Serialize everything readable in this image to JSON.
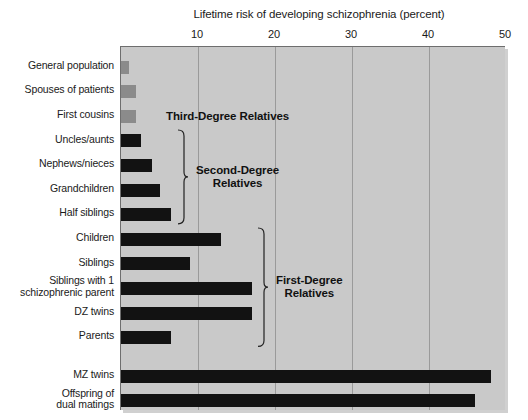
{
  "chart_data": {
    "type": "bar",
    "orientation": "horizontal",
    "title": "Lifetime risk of developing schizophrenia (percent)",
    "xlabel": "Lifetime risk of developing schizophrenia (percent)",
    "ylabel": "",
    "xlim": [
      0,
      50
    ],
    "xticks": [
      10,
      20,
      30,
      40,
      50
    ],
    "xtick_labels": [
      "10",
      "20",
      "30",
      "40",
      "50"
    ],
    "grid": "vertical",
    "legend": "none",
    "categories": [
      "General population",
      "Spouses of patients",
      "First cousins",
      "Uncles/aunts",
      "Nephews/nieces",
      "Grandchildren",
      "Half siblings",
      "Children",
      "Siblings",
      "Siblings with 1\nschizophrenic parent",
      "DZ twins",
      "Parents",
      "MZ twins",
      "Offspring of\ndual matings"
    ],
    "values": [
      1,
      2,
      2,
      2.6,
      4,
      5,
      6.5,
      13,
      9,
      17,
      17,
      6.5,
      48,
      46
    ],
    "bar_colors": [
      "#8b8b8b",
      "#8b8b8b",
      "#8b8b8b",
      "#121212",
      "#121212",
      "#121212",
      "#121212",
      "#121212",
      "#121212",
      "#121212",
      "#121212",
      "#121212",
      "#121212",
      "#121212"
    ],
    "annotations": [
      {
        "text": "Third-Degree Relatives",
        "group_rows": [
          0,
          2
        ]
      },
      {
        "text": "Second-Degree\nRelatives",
        "group_rows": [
          3,
          6
        ]
      },
      {
        "text": "First-Degree\nRelatives",
        "group_rows": [
          7,
          11
        ]
      }
    ],
    "colors": {
      "plot_background": "#c9c9c9",
      "gridline": "#9a9a9a",
      "bar_third_degree": "#8b8b8b",
      "bar_close_relative": "#121212",
      "text": "#1a1a1a",
      "page_background": "#ffffff"
    }
  },
  "axis": {
    "ticks": [
      {
        "label": "10",
        "value": 10
      },
      {
        "label": "20",
        "value": 20
      },
      {
        "label": "30",
        "value": 30
      },
      {
        "label": "40",
        "value": 40
      },
      {
        "label": "50",
        "value": 50
      }
    ]
  },
  "groups": {
    "third": "Third-Degree Relatives",
    "second": "Second-Degree\nRelatives",
    "first": "First-Degree\nRelatives"
  },
  "rows": [
    {
      "label": "General population",
      "value": 1,
      "tone": "gray"
    },
    {
      "label": "Spouses of patients",
      "value": 2,
      "tone": "gray"
    },
    {
      "label": "First cousins",
      "value": 2,
      "tone": "gray"
    },
    {
      "label": "Uncles/aunts",
      "value": 2.6,
      "tone": "black"
    },
    {
      "label": "Nephews/nieces",
      "value": 4,
      "tone": "black"
    },
    {
      "label": "Grandchildren",
      "value": 5,
      "tone": "black"
    },
    {
      "label": "Half siblings",
      "value": 6.5,
      "tone": "black"
    },
    {
      "label": "Children",
      "value": 13,
      "tone": "black"
    },
    {
      "label": "Siblings",
      "value": 9,
      "tone": "black"
    },
    {
      "label": "Siblings with 1\nschizophrenic parent",
      "value": 17,
      "tone": "black"
    },
    {
      "label": "DZ twins",
      "value": 17,
      "tone": "black"
    },
    {
      "label": "Parents",
      "value": 6.5,
      "tone": "black"
    },
    {
      "label": "MZ twins",
      "value": 48,
      "tone": "black"
    },
    {
      "label": "Offspring of\ndual matings",
      "value": 46,
      "tone": "black"
    }
  ]
}
